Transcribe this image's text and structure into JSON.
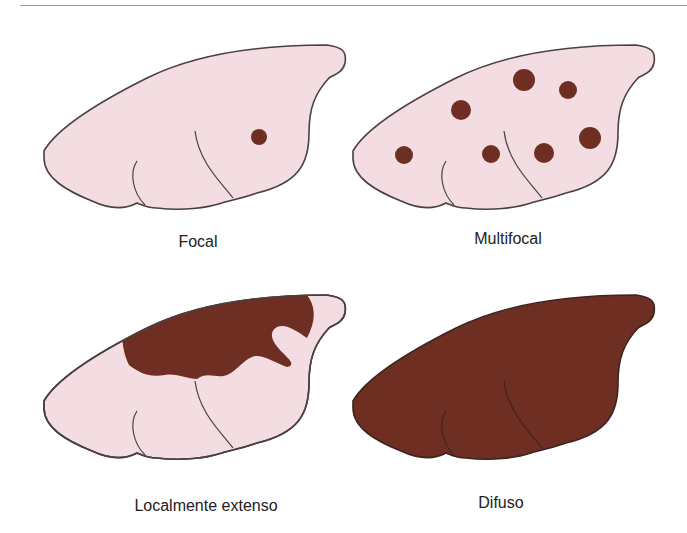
{
  "figure": {
    "colors": {
      "healthy": "#f4dde2",
      "lesion": "#6e2e22",
      "outline": "#4a4040"
    },
    "panels": [
      {
        "id": "focal",
        "label": "Focal",
        "spots": 1
      },
      {
        "id": "multifocal",
        "label": "Multifocal",
        "spots": 9
      },
      {
        "id": "localmente-extenso",
        "label": "Localmente extenso"
      },
      {
        "id": "difuso",
        "label": "Difuso"
      }
    ]
  }
}
